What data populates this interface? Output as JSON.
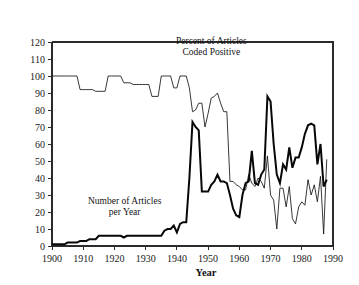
{
  "chart_data": {
    "type": "line",
    "title": "",
    "xlabel": "Year",
    "ylabel": "",
    "xlim": [
      1900,
      1990
    ],
    "ylim": [
      0,
      120
    ],
    "ytick_step": 10,
    "xtick_step": 10,
    "grid": false,
    "legend_position": "inline-annotations",
    "xticks": [
      1900,
      1910,
      1920,
      1930,
      1940,
      1950,
      1960,
      1970,
      1980,
      1990
    ],
    "yticks": [
      0,
      10,
      20,
      30,
      40,
      50,
      60,
      70,
      80,
      90,
      100,
      110,
      120
    ],
    "annotations": [
      {
        "name": "percent-series-label",
        "line1": "Percent of Articles",
        "line2": "Coded Positive"
      },
      {
        "name": "count-series-label",
        "line1": "Number of Articles",
        "line2": "per Year"
      }
    ],
    "series": [
      {
        "name": "Percent of Articles Coded Positive",
        "style": "thin",
        "color": "#141414",
        "x": [
          1900,
          1901,
          1902,
          1903,
          1904,
          1905,
          1906,
          1907,
          1908,
          1909,
          1910,
          1911,
          1912,
          1913,
          1914,
          1915,
          1916,
          1917,
          1918,
          1919,
          1920,
          1921,
          1922,
          1923,
          1924,
          1925,
          1926,
          1927,
          1928,
          1929,
          1930,
          1931,
          1932,
          1933,
          1934,
          1935,
          1936,
          1937,
          1938,
          1939,
          1940,
          1941,
          1942,
          1943,
          1944,
          1945,
          1946,
          1947,
          1948,
          1949,
          1950,
          1951,
          1952,
          1953,
          1954,
          1955,
          1956,
          1957,
          1958,
          1959,
          1960,
          1961,
          1962,
          1963,
          1964,
          1965,
          1966,
          1967,
          1968,
          1969,
          1970,
          1971,
          1972,
          1973,
          1974,
          1975,
          1976,
          1977,
          1978,
          1979,
          1980,
          1981,
          1982,
          1983,
          1984,
          1985,
          1986,
          1987,
          1988
        ],
        "values": [
          100,
          100,
          100,
          100,
          100,
          100,
          100,
          100,
          100,
          92,
          92,
          92,
          92,
          92,
          91,
          91,
          91,
          91,
          100,
          100,
          100,
          100,
          100,
          96,
          96,
          96,
          95,
          95,
          95,
          95,
          95,
          95,
          88,
          88,
          88,
          100,
          100,
          100,
          100,
          93,
          93,
          100,
          100,
          100,
          93,
          79,
          80,
          84,
          84,
          70,
          78,
          87,
          88,
          90,
          84,
          79,
          79,
          38,
          38,
          36,
          35,
          33,
          33,
          42,
          37,
          35,
          40,
          38,
          34,
          53,
          30,
          27,
          10,
          34,
          34,
          23,
          35,
          16,
          13,
          23,
          26,
          24,
          39,
          30,
          36,
          26,
          41,
          7,
          51
        ]
      },
      {
        "name": "Number of Articles per Year",
        "style": "thick",
        "color": "#080808",
        "x": [
          1900,
          1901,
          1902,
          1903,
          1904,
          1905,
          1906,
          1907,
          1908,
          1909,
          1910,
          1911,
          1912,
          1913,
          1914,
          1915,
          1916,
          1917,
          1918,
          1919,
          1920,
          1921,
          1922,
          1923,
          1924,
          1925,
          1926,
          1927,
          1928,
          1929,
          1930,
          1931,
          1932,
          1933,
          1934,
          1935,
          1936,
          1937,
          1938,
          1939,
          1940,
          1941,
          1942,
          1943,
          1944,
          1945,
          1946,
          1947,
          1948,
          1949,
          1950,
          1951,
          1952,
          1953,
          1954,
          1955,
          1956,
          1957,
          1958,
          1959,
          1960,
          1961,
          1962,
          1963,
          1964,
          1965,
          1966,
          1967,
          1968,
          1969,
          1970,
          1971,
          1972,
          1973,
          1974,
          1975,
          1976,
          1977,
          1978,
          1979,
          1980,
          1981,
          1982,
          1983,
          1984,
          1985,
          1986,
          1987,
          1988
        ],
        "values": [
          1,
          1,
          1,
          1,
          1,
          2,
          2,
          2,
          2,
          3,
          3,
          3,
          4,
          4,
          4,
          6,
          6,
          6,
          6,
          6,
          6,
          6,
          6,
          5,
          6,
          6,
          6,
          6,
          6,
          6,
          6,
          6,
          6,
          6,
          6,
          6,
          9,
          10,
          10,
          12,
          8,
          13,
          14,
          14,
          40,
          73,
          70,
          68,
          32,
          32,
          32,
          36,
          38,
          42,
          38,
          38,
          37,
          30,
          22,
          18,
          17,
          30,
          37,
          38,
          56,
          37,
          36,
          42,
          45,
          88,
          85,
          60,
          42,
          37,
          48,
          45,
          58,
          46,
          52,
          52,
          58,
          66,
          71,
          72,
          71,
          48,
          60,
          35,
          39
        ]
      }
    ]
  },
  "labels": {
    "x_axis_title": "Year"
  }
}
